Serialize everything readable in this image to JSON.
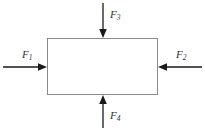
{
  "diagram": {
    "type": "free-body-diagram",
    "background_color": "#ffffff",
    "body": {
      "shape": "rectangle",
      "label": "",
      "stroke_color": "#8a8a8a",
      "fill": "none",
      "x": 47,
      "y": 38,
      "width": 111,
      "height": 57
    },
    "forces": [
      {
        "name": "F1",
        "symbol": "F",
        "subscript": "1",
        "side": "left",
        "direction": "right",
        "points_inward": true,
        "color": "#1a1a1a",
        "tail": {
          "x": 3,
          "y": 67
        },
        "tip": {
          "x": 47,
          "y": 67
        },
        "label_x": 22,
        "label_y": 55
      },
      {
        "name": "F2",
        "symbol": "F",
        "subscript": "2",
        "side": "right",
        "direction": "left",
        "points_inward": true,
        "color": "#1a1a1a",
        "tail": {
          "x": 202,
          "y": 67
        },
        "tip": {
          "x": 158,
          "y": 67
        },
        "label_x": 176,
        "label_y": 55
      },
      {
        "name": "F3",
        "symbol": "F",
        "subscript": "3",
        "side": "top",
        "direction": "down",
        "points_inward": true,
        "color": "#1a1a1a",
        "tail": {
          "x": 103,
          "y": 3
        },
        "tip": {
          "x": 103,
          "y": 38
        },
        "label_x": 110,
        "label_y": 15
      },
      {
        "name": "F4",
        "symbol": "F",
        "subscript": "4",
        "side": "bottom",
        "direction": "up",
        "points_inward": true,
        "color": "#1a1a1a",
        "tail": {
          "x": 103,
          "y": 128
        },
        "tip": {
          "x": 103,
          "y": 95
        },
        "label_x": 110,
        "label_y": 116
      }
    ]
  }
}
